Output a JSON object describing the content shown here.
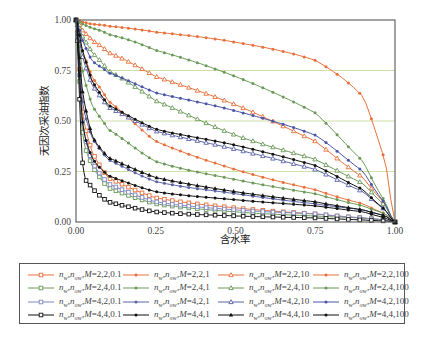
{
  "chart_data": {
    "type": "line",
    "title": "",
    "xlabel": "含水率",
    "ylabel": "无因次采油指数",
    "xlim": [
      0,
      1
    ],
    "ylim": [
      0,
      1
    ],
    "x_ticks": [
      "0.00",
      "0.25",
      "0.50",
      "0.75",
      "1.00"
    ],
    "y_ticks": [
      "0.00",
      "0.25",
      "0.50",
      "0.75",
      "1.00"
    ],
    "grid": {
      "horizontal": true,
      "color": "#cfe0a8"
    },
    "legend_position": "bottom",
    "x": [
      0,
      0.02,
      0.05,
      0.1,
      0.25,
      0.5,
      0.75,
      0.9,
      0.97,
      1.0
    ],
    "series": [
      {
        "name": "nw,now,M=2,2,0.1",
        "color": "#e8703a",
        "marker": "square-open",
        "values": [
          1.0,
          0.55,
          0.35,
          0.22,
          0.12,
          0.07,
          0.04,
          0.02,
          0.01,
          0.0
        ]
      },
      {
        "name": "nw,now,M=2,2,1",
        "color": "#e8703a",
        "marker": "dot",
        "values": [
          1.0,
          0.85,
          0.72,
          0.6,
          0.4,
          0.26,
          0.16,
          0.09,
          0.04,
          0.0
        ]
      },
      {
        "name": "nw,now,M=2,2,10",
        "color": "#e8703a",
        "marker": "triangle-open",
        "values": [
          1.0,
          0.95,
          0.9,
          0.84,
          0.72,
          0.58,
          0.4,
          0.22,
          0.09,
          0.0
        ]
      },
      {
        "name": "nw,now,M=2,2,100",
        "color": "#e8703a",
        "marker": "dot",
        "values": [
          1.0,
          0.99,
          0.98,
          0.97,
          0.94,
          0.89,
          0.8,
          0.62,
          0.3,
          0.0
        ]
      },
      {
        "name": "nw,now,M=2,4,0.1",
        "color": "#6a9a58",
        "marker": "square-open",
        "values": [
          1.0,
          0.45,
          0.28,
          0.17,
          0.09,
          0.05,
          0.03,
          0.02,
          0.01,
          0.0
        ]
      },
      {
        "name": "nw,now,M=2,4,1",
        "color": "#6a9a58",
        "marker": "dot",
        "values": [
          1.0,
          0.75,
          0.58,
          0.46,
          0.3,
          0.21,
          0.14,
          0.08,
          0.04,
          0.0
        ]
      },
      {
        "name": "nw,now,M=2,4,10",
        "color": "#6a9a58",
        "marker": "triangle-open",
        "values": [
          1.0,
          0.92,
          0.84,
          0.75,
          0.6,
          0.43,
          0.31,
          0.19,
          0.08,
          0.0
        ]
      },
      {
        "name": "nw,now,M=2,4,100",
        "color": "#6a9a58",
        "marker": "dot",
        "values": [
          1.0,
          0.98,
          0.96,
          0.93,
          0.85,
          0.72,
          0.54,
          0.3,
          0.1,
          0.0
        ]
      },
      {
        "name": "nw,now,M=4,2,0.1",
        "color": "#7d86c0",
        "marker": "square-open",
        "values": [
          1.0,
          0.5,
          0.3,
          0.19,
          0.1,
          0.06,
          0.04,
          0.02,
          0.01,
          0.0
        ]
      },
      {
        "name": "nw,now,M=4,2,1",
        "color": "#5a63a8",
        "marker": "dot",
        "values": [
          1.0,
          0.6,
          0.42,
          0.31,
          0.2,
          0.14,
          0.09,
          0.06,
          0.03,
          0.0
        ]
      },
      {
        "name": "nw,now,M=4,2,10",
        "color": "#5a63a8",
        "marker": "triangle-open",
        "values": [
          1.0,
          0.82,
          0.68,
          0.57,
          0.45,
          0.36,
          0.26,
          0.15,
          0.06,
          0.0
        ]
      },
      {
        "name": "nw,now,M=4,2,100",
        "color": "#4a55a8",
        "marker": "dot",
        "values": [
          1.0,
          0.9,
          0.8,
          0.74,
          0.64,
          0.55,
          0.43,
          0.25,
          0.09,
          0.0
        ]
      },
      {
        "name": "nw,now,M=4,4,0.1",
        "color": "#111111",
        "marker": "square-open",
        "values": [
          1.0,
          0.3,
          0.17,
          0.1,
          0.05,
          0.03,
          0.02,
          0.01,
          0.005,
          0.0
        ]
      },
      {
        "name": "nw,now,M=4,4,1",
        "color": "#111111",
        "marker": "dot",
        "values": [
          1.0,
          0.5,
          0.32,
          0.23,
          0.15,
          0.11,
          0.08,
          0.05,
          0.02,
          0.0
        ]
      },
      {
        "name": "nw,now,M=4,4,10",
        "color": "#111111",
        "marker": "triangle-filled",
        "values": [
          1.0,
          0.65,
          0.43,
          0.32,
          0.22,
          0.15,
          0.1,
          0.06,
          0.03,
          0.0
        ]
      },
      {
        "name": "nw,now,M=4,4,100",
        "color": "#111111",
        "marker": "dot",
        "values": [
          1.0,
          0.85,
          0.7,
          0.58,
          0.46,
          0.38,
          0.28,
          0.16,
          0.06,
          0.0
        ]
      }
    ]
  },
  "legend": {
    "items": [
      {
        "label_prefix": "n",
        "sub1": "w",
        "sep": ",",
        "sub2": "ow",
        "label_suffix": "M=2,2,0.1"
      },
      {
        "label_prefix": "n",
        "sub1": "w",
        "sep": ",",
        "sub2": "ow",
        "label_suffix": "M=2,2,1"
      },
      {
        "label_prefix": "n",
        "sub1": "w",
        "sep": ",",
        "sub2": "ow",
        "label_suffix": "M=2,2,10"
      },
      {
        "label_prefix": "n",
        "sub1": "w",
        "sep": ",",
        "sub2": "ow",
        "label_suffix": "M=2,2,100"
      },
      {
        "label_prefix": "n",
        "sub1": "w",
        "sep": ",",
        "sub2": "ow",
        "label_suffix": "M=2,4,0.1"
      },
      {
        "label_prefix": "n",
        "sub1": "w",
        "sep": ",",
        "sub2": "ow",
        "label_suffix": "M=2,4,1"
      },
      {
        "label_prefix": "n",
        "sub1": "w",
        "sep": ",",
        "sub2": "ow",
        "label_suffix": "M=2,4,10"
      },
      {
        "label_prefix": "n",
        "sub1": "w",
        "sep": ",",
        "sub2": "ow",
        "label_suffix": "M=2,4,100"
      },
      {
        "label_prefix": "n",
        "sub1": "w",
        "sep": ",",
        "sub2": "ow",
        "label_suffix": "M=4,2,0.1"
      },
      {
        "label_prefix": "n",
        "sub1": "w",
        "sep": ",",
        "sub2": "ow",
        "label_suffix": "M=4,2,1"
      },
      {
        "label_prefix": "n",
        "sub1": "w",
        "sep": ",",
        "sub2": "ow",
        "label_suffix": "M=4,2,10"
      },
      {
        "label_prefix": "n",
        "sub1": "w",
        "sep": ",",
        "sub2": "ow",
        "label_suffix": "M=4,2,100"
      },
      {
        "label_prefix": "n",
        "sub1": "w",
        "sep": ",",
        "sub2": "ow",
        "label_suffix": "M=4,4,0.1"
      },
      {
        "label_prefix": "n",
        "sub1": "w",
        "sep": ",",
        "sub2": "ow",
        "label_suffix": "M=4,4,1"
      },
      {
        "label_prefix": "n",
        "sub1": "w",
        "sep": ",",
        "sub2": "ow",
        "label_suffix": "M=4,4,10"
      },
      {
        "label_prefix": "n",
        "sub1": "w",
        "sep": ",",
        "sub2": "ow",
        "label_suffix": "M=4,4,100"
      }
    ]
  }
}
